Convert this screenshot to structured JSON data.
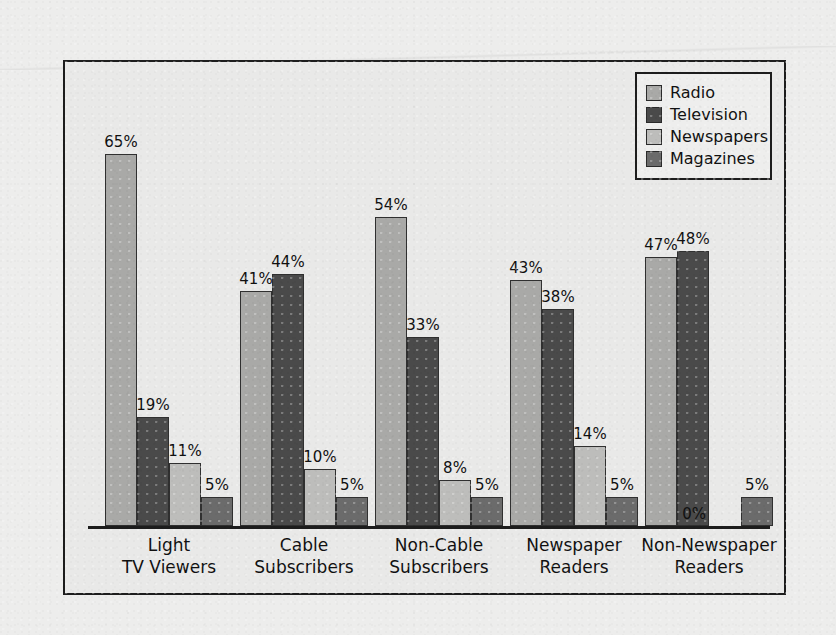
{
  "chart_data": {
    "type": "bar",
    "title": "",
    "subtitle": "",
    "xlabel": "",
    "ylabel": "",
    "ylim": [
      0,
      70
    ],
    "grid": false,
    "legend_position": "top-right",
    "value_suffix": "%",
    "categories": [
      "Light\nTV Viewers",
      "Cable\nSubscribers",
      "Non-Cable\nSubscribers",
      "Newspaper\nReaders",
      "Non-Newspaper\nReaders"
    ],
    "category_lines": [
      [
        "Light",
        "TV Viewers"
      ],
      [
        "Cable",
        "Subscribers"
      ],
      [
        "Non-Cable",
        "Subscribers"
      ],
      [
        "Newspaper",
        "Readers"
      ],
      [
        "Non-Newspaper",
        "Readers"
      ]
    ],
    "series": [
      {
        "name": "Radio",
        "color": "#a9a9a7",
        "values": [
          65,
          41,
          54,
          43,
          47
        ]
      },
      {
        "name": "Television",
        "color": "#4a4a4a",
        "values": [
          19,
          44,
          33,
          38,
          48
        ]
      },
      {
        "name": "Newspapers",
        "color": "#bdbdbb",
        "values": [
          11,
          10,
          8,
          14,
          0
        ]
      },
      {
        "name": "Magazines",
        "color": "#6b6b6b",
        "values": [
          5,
          5,
          5,
          5,
          5
        ]
      }
    ],
    "data_labels": [
      [
        "65%",
        "19%",
        "11%",
        "5%"
      ],
      [
        "41%",
        "44%",
        "10%",
        "5%"
      ],
      [
        "54%",
        "33%",
        "8%",
        "5%"
      ],
      [
        "43%",
        "38%",
        "14%",
        "5%"
      ],
      [
        "47%",
        "48%",
        "0%",
        "5%"
      ]
    ]
  },
  "legend": {
    "items": [
      {
        "label": "Radio",
        "color": "#a9a9a7"
      },
      {
        "label": "Television",
        "color": "#4a4a4a"
      },
      {
        "label": "Newspapers",
        "color": "#bdbdbb"
      },
      {
        "label": "Magazines",
        "color": "#6b6b6b"
      }
    ]
  },
  "colors": {
    "page_background": "#ededec",
    "plot_background": "#e9e9e8",
    "frame": "#1d1d1d",
    "axis": "#1d1d1d",
    "text": "#101010"
  }
}
